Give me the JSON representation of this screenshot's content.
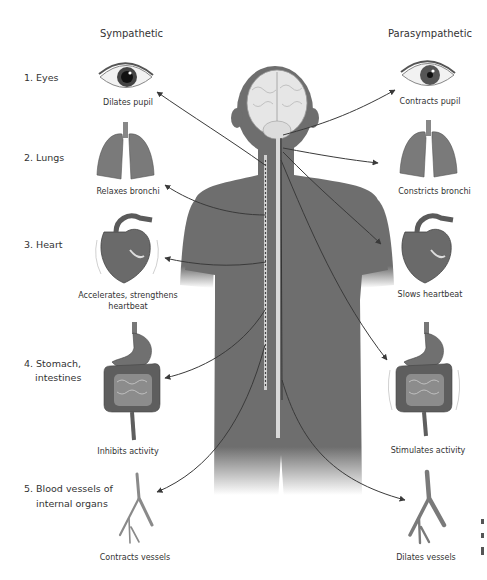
{
  "columns": {
    "left": "Sympathetic",
    "right": "Parasympathetic"
  },
  "rows": [
    {
      "number": "1.",
      "label": "Eyes",
      "label_lines": [
        "1. Eyes"
      ],
      "sympathetic": [
        "Dilates pupil"
      ],
      "parasympathetic": [
        "Contracts pupil"
      ],
      "organ": "eye"
    },
    {
      "number": "2.",
      "label": "Lungs",
      "label_lines": [
        "2. Lungs"
      ],
      "sympathetic": [
        "Relaxes bronchi"
      ],
      "parasympathetic": [
        "Constricts bronchi"
      ],
      "organ": "lungs"
    },
    {
      "number": "3.",
      "label": "Heart",
      "label_lines": [
        "3. Heart"
      ],
      "sympathetic": [
        "Accelerates, strengthens",
        "heartbeat"
      ],
      "parasympathetic": [
        "Slows heartbeat"
      ],
      "organ": "heart"
    },
    {
      "number": "4.",
      "label": "Stomach, intestines",
      "label_lines": [
        "4. Stomach,",
        "intestines"
      ],
      "sympathetic": [
        "Inhibits activity"
      ],
      "parasympathetic": [
        "Stimulates activity"
      ],
      "organ": "stomach-intestines"
    },
    {
      "number": "5.",
      "label": "Blood vessels of internal organs",
      "label_lines": [
        "5. Blood vessels of",
        "internal organs"
      ],
      "sympathetic": [
        "Contracts vessels"
      ],
      "parasympathetic": [
        "Dilates vessels"
      ],
      "organ": "blood-vessels"
    }
  ],
  "colors": {
    "body": "#6e6e6e",
    "organ": "#7a7a7a",
    "organ_dark": "#555555",
    "brain": "#e6e6e6",
    "spine": "#d9d9d9",
    "arrow": "#3a3a3a",
    "text": "#333333"
  }
}
